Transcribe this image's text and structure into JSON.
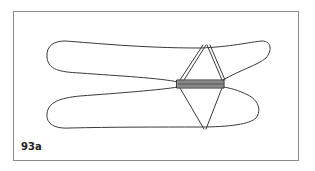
{
  "figure": {
    "label": "93a",
    "stroke_color": "#3a3a3a",
    "frame_color": "#8a8a8a"
  }
}
